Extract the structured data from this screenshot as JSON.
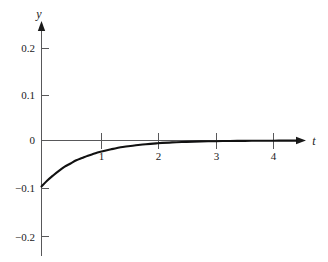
{
  "chart_data": {
    "type": "line",
    "title": "",
    "xlabel": "t",
    "ylabel": "y",
    "xlim": [
      -0.12,
      4.5
    ],
    "ylim": [
      -0.26,
      0.255
    ],
    "grid": false,
    "legend": null,
    "xticks": [
      {
        "value": 1,
        "label": "1"
      },
      {
        "value": 2,
        "label": "2"
      },
      {
        "value": 3,
        "label": "3"
      },
      {
        "value": 4,
        "label": "4"
      }
    ],
    "yticks": [
      {
        "value": 0.2,
        "label": "0.2"
      },
      {
        "value": 0.1,
        "label": "0.1"
      },
      {
        "value": 0.0,
        "label": "0"
      },
      {
        "value": -0.1,
        "label": "−0.1"
      },
      {
        "value": -0.2,
        "label": "−0.2"
      }
    ],
    "series": [
      {
        "name": "y(t)",
        "description": "exponential decay rising from -0.1 at t=0 asymptotically to 0",
        "x": [
          0.0,
          0.1,
          0.2,
          0.3,
          0.4,
          0.5,
          0.6,
          0.7,
          0.8,
          0.9,
          1.0,
          1.2,
          1.4,
          1.6,
          1.8,
          2.0,
          2.25,
          2.5,
          2.75,
          3.0,
          3.25,
          3.5,
          3.75,
          4.0,
          4.25,
          4.4
        ],
        "values": [
          -0.1,
          -0.087,
          -0.076,
          -0.066,
          -0.057,
          -0.05,
          -0.043,
          -0.038,
          -0.033,
          -0.029,
          -0.025,
          -0.019,
          -0.014,
          -0.011,
          -0.008,
          -0.006,
          -0.004,
          -0.003,
          -0.002,
          -0.0015,
          -0.001,
          -0.0008,
          -0.0005,
          -0.0004,
          -0.0002,
          -0.0002
        ]
      }
    ],
    "annotations": []
  },
  "axes": {
    "y_axis_name": "y",
    "x_axis_name": "t"
  }
}
